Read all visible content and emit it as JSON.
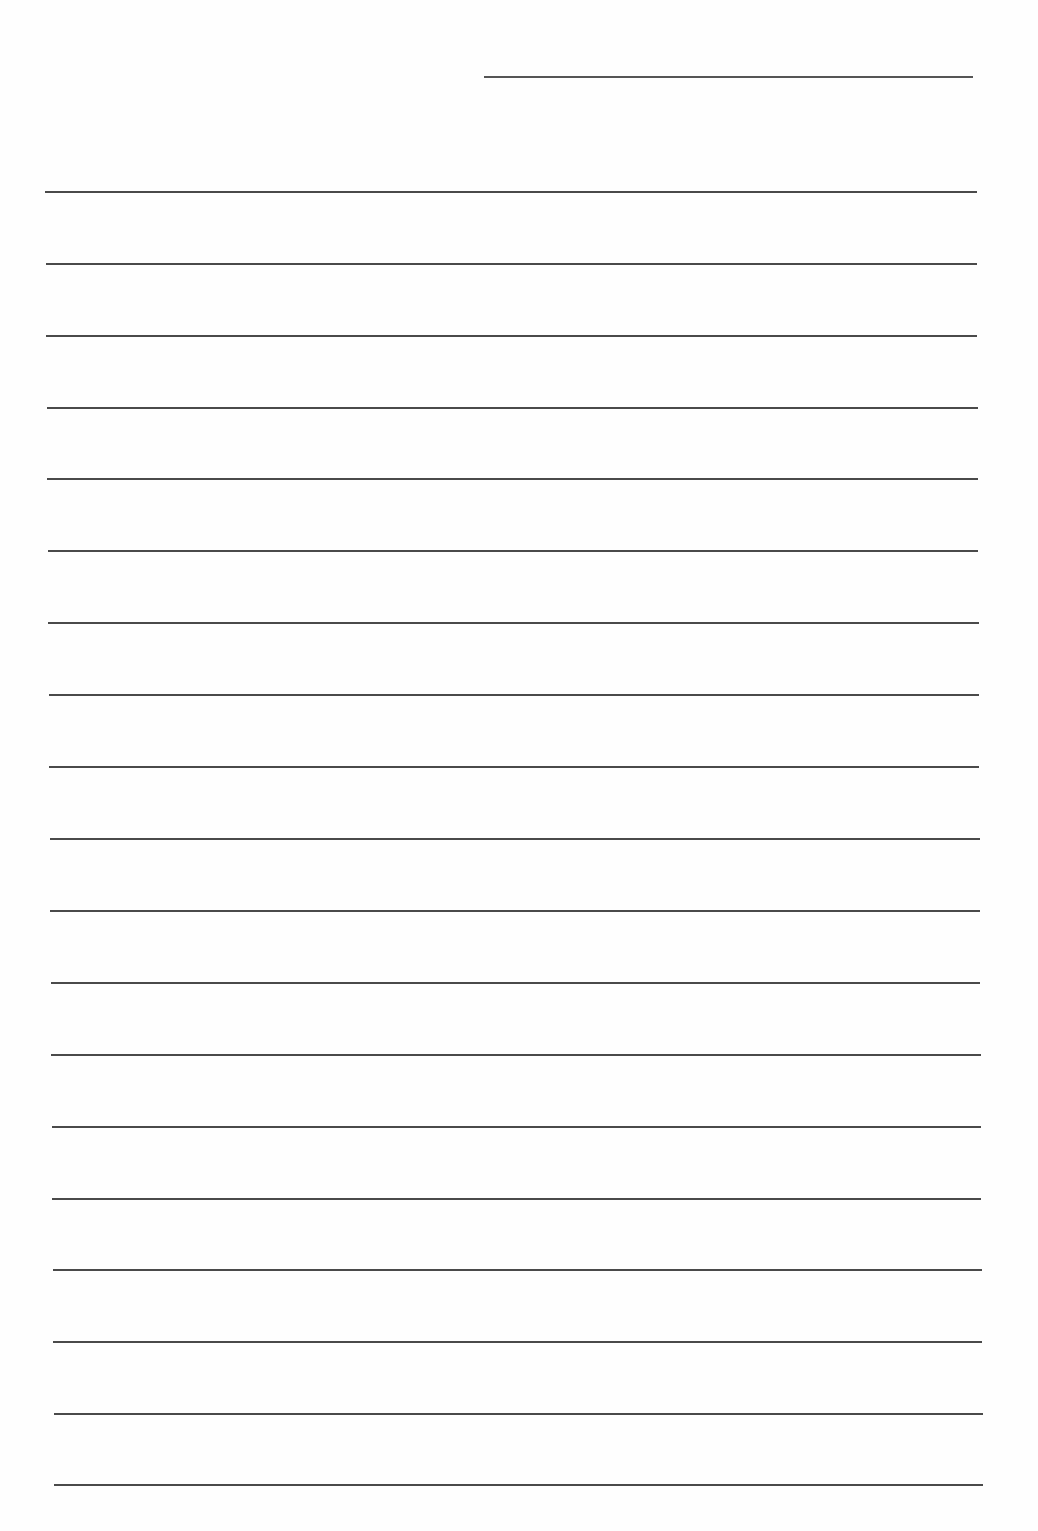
{
  "document": {
    "type": "ruled-writing-paper",
    "header_line": {
      "x1": 484,
      "x2": 973,
      "y": 76,
      "color": "#555555"
    },
    "rule_color": "#4a4a4a",
    "rules": [
      {
        "x1": 45,
        "x2": 977,
        "y": 191
      },
      {
        "x1": 46,
        "x2": 977,
        "y": 263
      },
      {
        "x1": 46,
        "x2": 977,
        "y": 335
      },
      {
        "x1": 47,
        "x2": 978,
        "y": 407
      },
      {
        "x1": 47,
        "x2": 978,
        "y": 478
      },
      {
        "x1": 48,
        "x2": 978,
        "y": 550
      },
      {
        "x1": 48,
        "x2": 979,
        "y": 622
      },
      {
        "x1": 49,
        "x2": 979,
        "y": 694
      },
      {
        "x1": 49,
        "x2": 979,
        "y": 766
      },
      {
        "x1": 50,
        "x2": 980,
        "y": 838
      },
      {
        "x1": 50,
        "x2": 980,
        "y": 910
      },
      {
        "x1": 51,
        "x2": 980,
        "y": 982
      },
      {
        "x1": 51,
        "x2": 981,
        "y": 1054
      },
      {
        "x1": 52,
        "x2": 981,
        "y": 1126
      },
      {
        "x1": 52,
        "x2": 981,
        "y": 1198
      },
      {
        "x1": 53,
        "x2": 982,
        "y": 1269
      },
      {
        "x1": 53,
        "x2": 982,
        "y": 1341
      },
      {
        "x1": 54,
        "x2": 983,
        "y": 1413
      },
      {
        "x1": 54,
        "x2": 983,
        "y": 1484
      }
    ]
  }
}
